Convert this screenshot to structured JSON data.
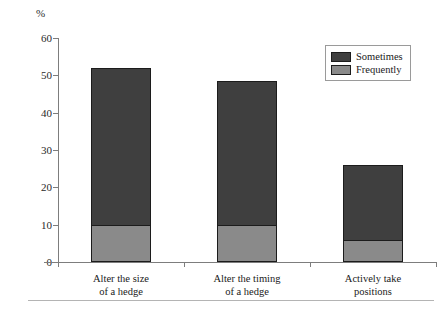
{
  "chart_data": {
    "type": "bar",
    "subtype": "stacked-vertical",
    "title": "",
    "xlabel": "",
    "ylabel": "%",
    "ylim": [
      0,
      60
    ],
    "yticks": [
      0,
      10,
      20,
      30,
      40,
      50,
      60
    ],
    "ytick_labels": [
      "0",
      "10",
      "20",
      "30",
      "40",
      "50",
      "60"
    ],
    "grid": false,
    "legend_position": "top-right",
    "categories": [
      "Alter the size of a hedge",
      "Alter the timing of a hedge",
      "Actively take positions"
    ],
    "category_lines": [
      [
        "Alter the size",
        "of a hedge"
      ],
      [
        "Alter the timing",
        "of a hedge"
      ],
      [
        "Actively take",
        "positions"
      ]
    ],
    "series": [
      {
        "name": "Frequently",
        "color": "#8a8a8a",
        "values": [
          10,
          10,
          6
        ]
      },
      {
        "name": "Sometimes",
        "color": "#3f3f3f",
        "values": [
          42,
          38.5,
          20
        ]
      }
    ],
    "stack_order_bottom_to_top": [
      "Frequently",
      "Sometimes"
    ],
    "totals": [
      52,
      48.5,
      26
    ],
    "legend_entries": [
      {
        "label": "Sometimes",
        "color": "#3f3f3f"
      },
      {
        "label": "Frequently",
        "color": "#8a8a8a"
      }
    ]
  },
  "axis": {
    "unit_label": "%"
  },
  "colors": {
    "sometimes": "#3f3f3f",
    "frequently": "#8a8a8a",
    "axis": "#7d7d7d",
    "bar_outline": "#1c1c1c",
    "footer_rule": "#b4b4b4",
    "background": "#ffffff"
  }
}
